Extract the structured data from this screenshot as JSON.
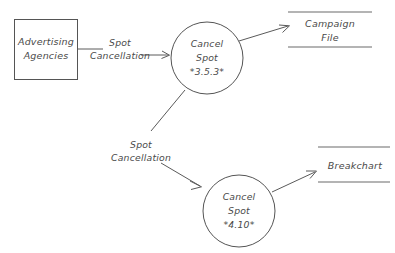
{
  "diagram": {
    "background_color": "#ffffff",
    "line_color": "#555555",
    "text_color": "#4a4a4a"
  },
  "external_entities": [
    {
      "id": "advertising-agencies",
      "line1": "Advertising",
      "line2": "Agencies"
    }
  ],
  "processes": [
    {
      "id": "cancel-spot-353",
      "line1": "Cancel",
      "line2": "Spot",
      "line3": "*3.5.3*"
    },
    {
      "id": "cancel-spot-410",
      "line1": "Cancel",
      "line2": "Spot",
      "line3": "*4.10*"
    }
  ],
  "data_stores": [
    {
      "id": "campaign-file",
      "line1": "Campaign",
      "line2": "File"
    },
    {
      "id": "breakchart",
      "line1": "Breakchart",
      "line2": ""
    }
  ],
  "flows": [
    {
      "id": "flow-agency-to-process-353",
      "line1": "Spot",
      "line2": "Cancellation"
    },
    {
      "id": "flow-process-353-to-process-410",
      "line1": "Spot",
      "line2": "Cancellation"
    }
  ]
}
